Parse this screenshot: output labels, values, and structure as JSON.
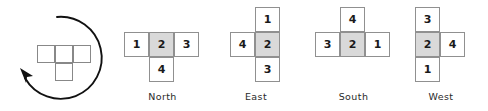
{
  "figure": {
    "type": "rotation-diagram"
  },
  "rotation_panel": {
    "arrow": {
      "icon": "counterclockwise-rotation-arrow",
      "direction": "counterclockwise",
      "color": "#111111"
    },
    "shape": {
      "name": "t-tetromino",
      "outline_color": "#888888",
      "cells": [
        {
          "col": 0,
          "row": 0
        },
        {
          "col": 1,
          "row": 0
        },
        {
          "col": 2,
          "row": 0
        },
        {
          "col": 1,
          "row": 1
        }
      ]
    }
  },
  "style": {
    "cell_border": "#909090",
    "cell_fill": "#ffffff",
    "shaded_fill": "#d9d9d9",
    "text_color": "#1a1a1a"
  },
  "orientations": [
    {
      "label": "North",
      "cells": [
        {
          "value": "1",
          "col": 0,
          "row": 0,
          "shaded": false
        },
        {
          "value": "2",
          "col": 1,
          "row": 0,
          "shaded": true
        },
        {
          "value": "3",
          "col": 2,
          "row": 0,
          "shaded": false
        },
        {
          "value": "4",
          "col": 1,
          "row": 1,
          "shaded": false
        }
      ]
    },
    {
      "label": "East",
      "cells": [
        {
          "value": "1",
          "col": 1,
          "row": 0,
          "shaded": false
        },
        {
          "value": "4",
          "col": 0,
          "row": 1,
          "shaded": false
        },
        {
          "value": "2",
          "col": 1,
          "row": 1,
          "shaded": true
        },
        {
          "value": "3",
          "col": 1,
          "row": 2,
          "shaded": false
        }
      ]
    },
    {
      "label": "South",
      "cells": [
        {
          "value": "4",
          "col": 1,
          "row": 0,
          "shaded": false
        },
        {
          "value": "3",
          "col": 0,
          "row": 1,
          "shaded": false
        },
        {
          "value": "2",
          "col": 1,
          "row": 1,
          "shaded": true
        },
        {
          "value": "1",
          "col": 2,
          "row": 1,
          "shaded": false
        }
      ]
    },
    {
      "label": "West",
      "cells": [
        {
          "value": "3",
          "col": 0,
          "row": 0,
          "shaded": false
        },
        {
          "value": "2",
          "col": 0,
          "row": 1,
          "shaded": true
        },
        {
          "value": "4",
          "col": 1,
          "row": 1,
          "shaded": false
        },
        {
          "value": "1",
          "col": 0,
          "row": 2,
          "shaded": false
        }
      ]
    }
  ]
}
